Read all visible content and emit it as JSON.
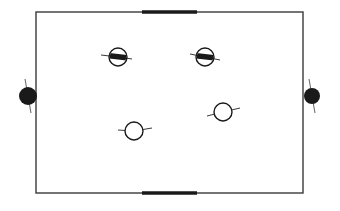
{
  "diagram": {
    "type": "court-top-view",
    "colors": {
      "background": "#ffffff",
      "line": "#3a3a3a",
      "fill_dark": "#1a1a1a",
      "player_fill": "#ffffff"
    },
    "court": {
      "x": 36,
      "y": 12,
      "width": 267,
      "height": 181
    },
    "goals": [
      {
        "id": "top-goal",
        "x1": 142,
        "x2": 197,
        "y": 12
      },
      {
        "id": "bottom-goal",
        "x1": 142,
        "x2": 197,
        "y": 193
      }
    ],
    "side_markers": [
      {
        "id": "left-marker",
        "cx": 28,
        "cy": 96,
        "r": 9
      },
      {
        "id": "right-marker",
        "cx": 312,
        "cy": 96,
        "r": 8
      }
    ],
    "players": [
      {
        "id": "player-1",
        "team": "dark",
        "cx": 118,
        "cy": 57,
        "r": 9,
        "arm_left": [
          101,
          55
        ],
        "arm_right": [
          132,
          59
        ]
      },
      {
        "id": "player-2",
        "team": "dark",
        "cx": 205,
        "cy": 57,
        "r": 9,
        "arm_left": [
          190,
          54
        ],
        "arm_right": [
          220,
          60
        ]
      },
      {
        "id": "player-3",
        "team": "light",
        "cx": 134,
        "cy": 131,
        "r": 9,
        "arm_left": [
          118,
          130
        ],
        "arm_right": [
          152,
          128
        ]
      },
      {
        "id": "player-4",
        "team": "light",
        "cx": 223,
        "cy": 112,
        "r": 9,
        "arm_left": [
          207,
          116
        ],
        "arm_right": [
          240,
          108
        ]
      }
    ]
  }
}
